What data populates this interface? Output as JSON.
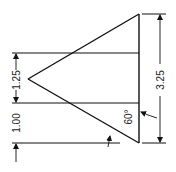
{
  "diagram": {
    "type": "technical-drawing",
    "shape": "triangle",
    "dimensions": {
      "upper_height": "1.25",
      "lower_offset": "1.00",
      "total_height": "3.25",
      "angle": "60°"
    },
    "colors": {
      "line": "#111111",
      "background": "#ffffff"
    }
  }
}
